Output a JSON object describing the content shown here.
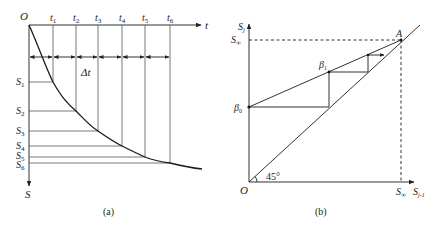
{
  "panel_a": {
    "caption": "(a)",
    "origin_label": "O",
    "x_axis_label": "t",
    "y_axis_label": "S",
    "interval_label": "Δt",
    "t_labels": [
      {
        "main": "t",
        "sub": "1"
      },
      {
        "main": "t",
        "sub": "2"
      },
      {
        "main": "t",
        "sub": "3"
      },
      {
        "main": "t",
        "sub": "4"
      },
      {
        "main": "t",
        "sub": "5"
      },
      {
        "main": "t",
        "sub": "6"
      }
    ],
    "s_labels": [
      {
        "main": "S",
        "sub": "1"
      },
      {
        "main": "S",
        "sub": "2"
      },
      {
        "main": "S",
        "sub": "3"
      },
      {
        "main": "S",
        "sub": "4"
      },
      {
        "main": "S",
        "sub": "5"
      },
      {
        "main": "S",
        "sub": "6"
      }
    ]
  },
  "panel_b": {
    "caption": "(b)",
    "origin_label": "O",
    "y_axis_label": {
      "main": "S",
      "sub": "j"
    },
    "y_inf_label": {
      "main": "S",
      "sub": "∞"
    },
    "x_inf_label": {
      "main": "S",
      "sub": "∞"
    },
    "x_axis_label": {
      "main": "S",
      "sub": "j-1"
    },
    "angle_label": "45°",
    "point_a_label": "A",
    "beta0_label": {
      "main": "β",
      "sub": "0"
    },
    "beta1_label": {
      "main": "β",
      "sub": "1"
    }
  }
}
